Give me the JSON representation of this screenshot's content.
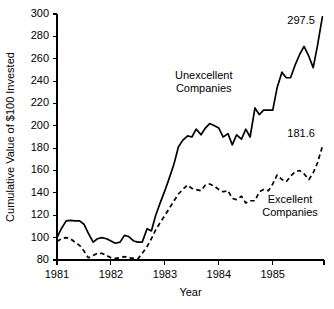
{
  "chart_data": {
    "type": "line",
    "title": "",
    "xlabel": "Year",
    "ylabel": "Cumulative Value of $100 Invested",
    "xlim": [
      1981.0,
      1985.95
    ],
    "ylim": [
      80,
      300
    ],
    "ytick_values": [
      80,
      100,
      120,
      140,
      160,
      180,
      200,
      220,
      240,
      260,
      280,
      300
    ],
    "ytick_labels": [
      "80",
      "100",
      "120",
      "140",
      "160",
      "180",
      "200",
      "220",
      "240",
      "260",
      "280",
      "300"
    ],
    "xtick_values": [
      1981,
      1982,
      1983,
      1984,
      1985
    ],
    "xtick_labels": [
      "1981",
      "1982",
      "1983",
      "1984",
      "1985"
    ],
    "grid": false,
    "legend_position": "inline-annotations",
    "series": [
      {
        "name": "Unexcellent Companies",
        "style": "solid",
        "end_value_label": "297.5",
        "annotation_label": [
          "Unexcellent",
          "Companies"
        ],
        "x": [
          1981.0,
          1981.08,
          1981.17,
          1981.25,
          1981.33,
          1981.42,
          1981.5,
          1981.58,
          1981.67,
          1981.75,
          1981.83,
          1981.92,
          1982.0,
          1982.08,
          1982.17,
          1982.25,
          1982.33,
          1982.42,
          1982.5,
          1982.58,
          1982.67,
          1982.75,
          1982.83,
          1982.92,
          1983.0,
          1983.08,
          1983.17,
          1983.25,
          1983.33,
          1983.42,
          1983.5,
          1983.58,
          1983.67,
          1983.75,
          1983.83,
          1983.92,
          1984.0,
          1984.08,
          1984.17,
          1984.25,
          1984.33,
          1984.42,
          1984.5,
          1984.58,
          1984.67,
          1984.75,
          1984.83,
          1984.92,
          1985.0,
          1985.08,
          1985.17,
          1985.25,
          1985.33,
          1985.42,
          1985.5,
          1985.58,
          1985.67,
          1985.75,
          1985.83,
          1985.92
        ],
        "values": [
          100.0,
          108.0,
          115.0,
          115.5,
          115.0,
          115.0,
          112.0,
          104.0,
          96.0,
          99.0,
          100.0,
          99.0,
          97.0,
          95.0,
          96.0,
          102.0,
          101.0,
          97.0,
          96.0,
          96.0,
          108.0,
          106.0,
          120.0,
          132.0,
          142.0,
          153.0,
          166.0,
          181.0,
          187.0,
          191.0,
          190.0,
          197.0,
          192.0,
          198.0,
          202.0,
          200.0,
          198.0,
          190.0,
          193.0,
          183.0,
          192.0,
          188.0,
          197.0,
          190.0,
          216.0,
          210.0,
          214.0,
          214.0,
          214.0,
          234.0,
          248.0,
          243.0,
          243.0,
          255.0,
          264.0,
          271.0,
          262.0,
          252.0,
          272.0,
          297.5
        ]
      },
      {
        "name": "Excellent Companies",
        "style": "dashed",
        "end_value_label": "181.6",
        "annotation_label": [
          "Excellent",
          "Companies"
        ],
        "x": [
          1981.0,
          1981.08,
          1981.17,
          1981.25,
          1981.33,
          1981.42,
          1981.5,
          1981.58,
          1981.67,
          1981.75,
          1981.83,
          1981.92,
          1982.0,
          1982.08,
          1982.17,
          1982.25,
          1982.33,
          1982.42,
          1982.5,
          1982.58,
          1982.67,
          1982.75,
          1982.83,
          1982.92,
          1983.0,
          1983.08,
          1983.17,
          1983.25,
          1983.33,
          1983.42,
          1983.5,
          1983.58,
          1983.67,
          1983.75,
          1983.83,
          1983.92,
          1984.0,
          1984.08,
          1984.17,
          1984.25,
          1984.33,
          1984.42,
          1984.5,
          1984.58,
          1984.67,
          1984.75,
          1984.83,
          1984.92,
          1985.0,
          1985.08,
          1985.17,
          1985.25,
          1985.33,
          1985.42,
          1985.5,
          1985.58,
          1985.67,
          1985.75,
          1985.83,
          1985.92
        ],
        "values": [
          96.5,
          99.0,
          100.0,
          99.0,
          96.0,
          93.0,
          88.0,
          82.0,
          84.0,
          86.0,
          86.0,
          84.0,
          82.0,
          81.5,
          82.0,
          83.0,
          82.0,
          81.5,
          81.0,
          86.0,
          92.0,
          99.0,
          107.0,
          114.0,
          120.0,
          126.0,
          133.0,
          139.0,
          143.0,
          147.0,
          144.0,
          143.0,
          142.0,
          147.0,
          148.0,
          146.0,
          143.0,
          141.0,
          142.0,
          135.0,
          134.0,
          137.0,
          131.0,
          133.0,
          133.0,
          141.0,
          143.0,
          142.0,
          148.0,
          156.0,
          152.0,
          150.0,
          155.0,
          159.0,
          160.0,
          157.0,
          152.0,
          158.0,
          167.0,
          181.6
        ]
      }
    ],
    "annotations": [
      {
        "name": "unexcellent-label",
        "text_lines": [
          "Unexcellent",
          "Companies"
        ],
        "x": 1983.72,
        "y": 242
      },
      {
        "name": "excellent-label",
        "text_lines": [
          "Excellent",
          "Companies"
        ],
        "x": 1985.32,
        "y": 131
      },
      {
        "name": "unexcellent-end-value",
        "text": "297.5",
        "x": 1985.78,
        "y": 291
      },
      {
        "name": "excellent-end-value",
        "text": "181.6",
        "x": 1985.78,
        "y": 190
      }
    ]
  },
  "colors": {
    "background": "#ffffff",
    "ink": "#000000"
  }
}
